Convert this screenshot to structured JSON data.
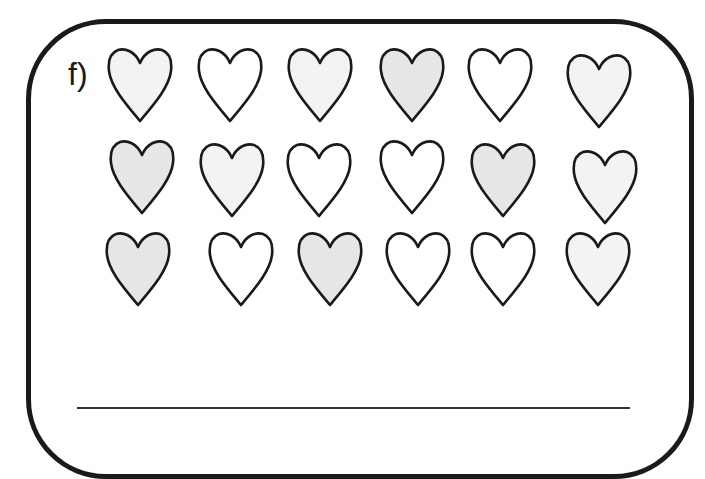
{
  "exercise": {
    "label": "f)",
    "colors": {
      "outline": "#1a1a1a",
      "shaded": "#e6e6e6",
      "light": "#f3f3f3",
      "empty": "#ffffff"
    },
    "rows": [
      {
        "hearts": [
          {
            "fill": "light",
            "x": 107,
            "y": 45
          },
          {
            "fill": "empty",
            "x": 197,
            "y": 45
          },
          {
            "fill": "light",
            "x": 287,
            "y": 45
          },
          {
            "fill": "shaded",
            "x": 379,
            "y": 45
          },
          {
            "fill": "empty",
            "x": 467,
            "y": 45
          },
          {
            "fill": "light",
            "x": 566,
            "y": 51
          }
        ]
      },
      {
        "hearts": [
          {
            "fill": "shaded",
            "x": 109,
            "y": 137
          },
          {
            "fill": "light",
            "x": 199,
            "y": 140
          },
          {
            "fill": "empty",
            "x": 286,
            "y": 140
          },
          {
            "fill": "empty",
            "x": 379,
            "y": 137
          },
          {
            "fill": "shaded",
            "x": 470,
            "y": 140
          },
          {
            "fill": "light",
            "x": 572,
            "y": 147
          }
        ]
      },
      {
        "hearts": [
          {
            "fill": "shaded",
            "x": 105,
            "y": 229
          },
          {
            "fill": "empty",
            "x": 208,
            "y": 229
          },
          {
            "fill": "shaded",
            "x": 297,
            "y": 229
          },
          {
            "fill": "empty",
            "x": 385,
            "y": 229
          },
          {
            "fill": "empty",
            "x": 470,
            "y": 229
          },
          {
            "fill": "light",
            "x": 565,
            "y": 229
          }
        ]
      }
    ],
    "answer_line": {
      "value": ""
    }
  }
}
